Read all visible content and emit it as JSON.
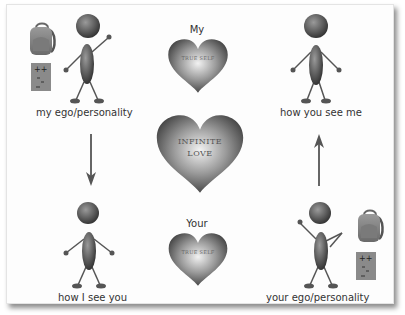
{
  "diagram": {
    "labels": {
      "top_left": "my ego/personality",
      "top_right": "how you see me",
      "bottom_left": "how I see you",
      "bottom_right": "your ego/personality"
    },
    "hearts": {
      "top": {
        "title": "My",
        "inner": "TRUE SELF"
      },
      "center": {
        "line1": "INFINITE",
        "line2": "LOVE"
      },
      "bottom": {
        "title": "Your",
        "inner": "TRUE SELF"
      }
    },
    "arrows": {
      "left": "down",
      "right": "up"
    },
    "icons": [
      "backpack-icon",
      "score-card-icon"
    ],
    "colors": {
      "figure": "#5e5e5e",
      "heart_outer": "#555555",
      "heart_inner": "#f0f0f0",
      "arrow": "#666666",
      "text": "#333333"
    },
    "score_card_marks": [
      "+ +",
      "-",
      "-"
    ]
  }
}
